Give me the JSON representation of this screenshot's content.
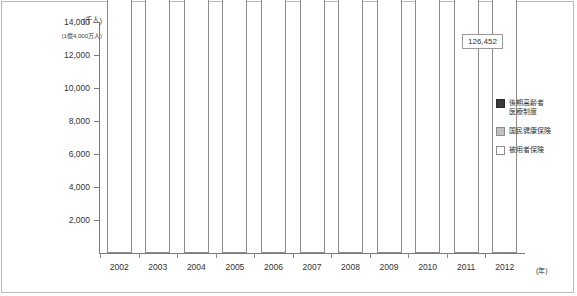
{
  "chart_data": {
    "type": "bar",
    "stacked": true,
    "title": "",
    "xlabel": "(年)",
    "ylabel": "(千人)",
    "y_max_note": "(1億4,000万人)",
    "ylim": [
      0,
      14000
    ],
    "yticks": [
      "2,000",
      "4,000",
      "6,000",
      "8,000",
      "10,000",
      "12,000",
      "14,000"
    ],
    "ytick_values": [
      2000,
      4000,
      6000,
      8000,
      10000,
      12000,
      14000
    ],
    "grid": false,
    "legend_position": "right",
    "categories": [
      "2002",
      "2003",
      "2004",
      "2005",
      "2006",
      "2007",
      "2008",
      "2009",
      "2010",
      "2011",
      "2012"
    ],
    "series": [
      {
        "name": "被用者保険",
        "key": "employee",
        "color": "#ffffff",
        "values": [
          76441,
          75621,
          75519,
          75549,
          76033,
          76703,
          74226,
          74055,
          73797,
          73632,
          73605
        ],
        "labels": [
          "76,441",
          "75,621",
          "75,519",
          "75,549",
          "76,033",
          "76,703",
          "74,226",
          "74,055",
          "73,797",
          "73,632",
          "73,605"
        ]
      },
      {
        "name": "国民健康保険",
        "key": "national",
        "color": "#bfbfbf",
        "values": [
          50597,
          50936,
          51578,
          51677,
          51268,
          50704,
          39492,
          39098,
          38769,
          38313,
          37678
        ],
        "labels": [
          "50,597",
          "50,936",
          "51,578",
          "51,677",
          "51,268",
          "50,704",
          "39,492",
          "39,098",
          "38,769",
          "38,313",
          "37,678"
        ]
      },
      {
        "name": "後期高齢者医療制度",
        "key": "elderly",
        "color": "#3a3a3a",
        "values": [
          0,
          0,
          0,
          0,
          0,
          0,
          13408,
          13604,
          14041,
          14738,
          15168
        ],
        "labels": [
          "",
          "",
          "",
          "",
          "",
          "",
          "13,408",
          "13,604",
          "14,041",
          "14,738",
          "15,168"
        ]
      }
    ],
    "annotations": [
      {
        "name": "total-2012",
        "text": "126,452",
        "target_category": "2012"
      }
    ]
  },
  "legend": {
    "items": [
      {
        "label_line1": "後期高齢者",
        "label_line2": "医療制度",
        "swatch": "elderly"
      },
      {
        "label_line1": "国民健康保険",
        "label_line2": "",
        "swatch": "national"
      },
      {
        "label_line1": "被用者保険",
        "label_line2": "",
        "swatch": "employee"
      }
    ]
  }
}
